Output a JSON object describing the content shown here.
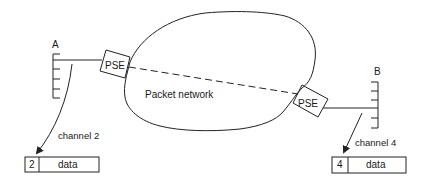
{
  "diagram": {
    "type": "packet-switched network virtual circuit",
    "network": {
      "label": "Packet network"
    },
    "nodes": [
      {
        "id": "A",
        "label": "A",
        "side": "left",
        "ports": 5
      },
      {
        "id": "B",
        "label": "B",
        "side": "right",
        "ports": 5
      }
    ],
    "switches": [
      {
        "id": "pse-left",
        "label": "PSE",
        "connects": "A"
      },
      {
        "id": "pse-right",
        "label": "PSE",
        "connects": "B"
      }
    ],
    "virtual_link": {
      "from": "pse-left",
      "to": "pse-right",
      "style": "dashed"
    },
    "channels": [
      {
        "label": "channel 2",
        "node": "A",
        "packet": {
          "channel_number": "2",
          "payload": "data"
        }
      },
      {
        "label": "channel 4",
        "node": "B",
        "packet": {
          "channel_number": "4",
          "payload": "data"
        }
      }
    ]
  }
}
